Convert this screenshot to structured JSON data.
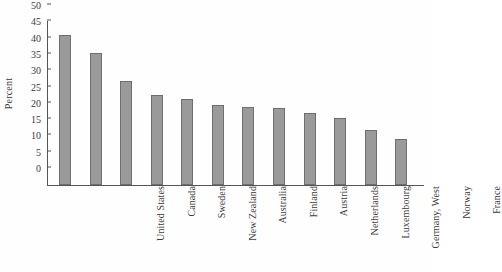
{
  "chart_data": {
    "type": "bar",
    "title": "",
    "xlabel": "",
    "ylabel": "Percent",
    "ylim": [
      0,
      50
    ],
    "yticks": [
      0,
      5,
      10,
      15,
      20,
      25,
      30,
      35,
      40,
      45,
      50
    ],
    "grid": false,
    "legend": null,
    "orientation": "vertical",
    "bar_color": "#9a9a9a",
    "bar_edge_color": "#6e6e6e",
    "background_color": "#fefefe",
    "categories": [
      "United States",
      "Canada",
      "Sweden",
      "New Zealand",
      "Australia",
      "Finland",
      "Austria",
      "Netherlands",
      "Luxembourg",
      "Germany, West",
      "Norway",
      "France"
    ],
    "values": [
      46,
      40.5,
      32,
      27.5,
      26.5,
      24.5,
      24,
      23.5,
      22,
      20.5,
      17,
      14
    ]
  }
}
